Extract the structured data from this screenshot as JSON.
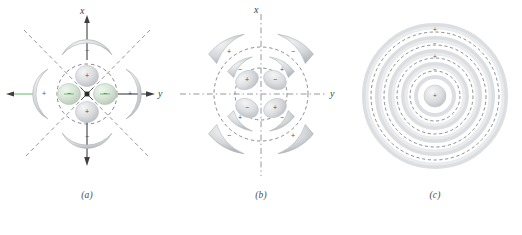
{
  "figure": {
    "background_color": "#ffffff",
    "lobe_fill": "#d7d9dc",
    "lobe_edge": "#b8bbbf",
    "node_line_color": "#6f6f75",
    "axis_color": "#3f3f3f",
    "accent_green": "#7dc47d",
    "accent_purple": "#9a7fb0",
    "sign_color": "#4c4c4c"
  },
  "panels": [
    {
      "id": "a",
      "caption": "(a)",
      "axes": {
        "vertical_label": "x",
        "horizontal_label": "y"
      },
      "nucleus": "nucleus-dot",
      "node_lines": "two diagonal dashed lines plus one dashed circle",
      "inner_lobes": [
        {
          "position": "top",
          "sign": "+"
        },
        {
          "position": "left",
          "sign": "−"
        },
        {
          "position": "right",
          "sign": "−"
        },
        {
          "position": "bottom",
          "sign": "+"
        }
      ],
      "outer_lobes": [
        {
          "position": "top",
          "sign": "−"
        },
        {
          "position": "left",
          "sign": "+"
        },
        {
          "position": "right",
          "sign": "+"
        },
        {
          "position": "bottom",
          "sign": "−"
        }
      ],
      "green_arrow": "left-pointing green arrow"
    },
    {
      "id": "b",
      "caption": "(b)",
      "axes": {
        "vertical_label": "x",
        "horizontal_label": "y"
      },
      "node_lines": "dash-dot axes plus two dashed circles",
      "ring_inner": [
        {
          "position": "upper-left",
          "sign": "+"
        },
        {
          "position": "upper-right",
          "sign": "−"
        },
        {
          "position": "lower-left",
          "sign": "−"
        },
        {
          "position": "lower-right",
          "sign": "+"
        }
      ],
      "ring_middle": [
        {
          "position": "upper-left",
          "sign": "−"
        },
        {
          "position": "upper-right",
          "sign": "+"
        },
        {
          "position": "lower-left",
          "sign": "+"
        },
        {
          "position": "lower-right",
          "sign": "−"
        }
      ],
      "ring_outer": [
        {
          "position": "upper-left",
          "sign": "+"
        },
        {
          "position": "upper-right",
          "sign": "−"
        },
        {
          "position": "lower-left",
          "sign": "−"
        },
        {
          "position": "lower-right",
          "sign": "+"
        }
      ]
    },
    {
      "id": "c",
      "caption": "(c)",
      "axes": {
        "vertical_label": "",
        "horizontal_label": ""
      },
      "node_lines": "four dashed concentric circles",
      "shells": [
        {
          "index": 0,
          "name": "core",
          "sign": "+"
        },
        {
          "index": 1,
          "name": "shell-1",
          "sign": "−"
        },
        {
          "index": 2,
          "name": "shell-2",
          "sign": "+"
        },
        {
          "index": 3,
          "name": "shell-3",
          "sign": "−"
        },
        {
          "index": 4,
          "name": "shell-4",
          "sign": "+"
        }
      ]
    }
  ]
}
